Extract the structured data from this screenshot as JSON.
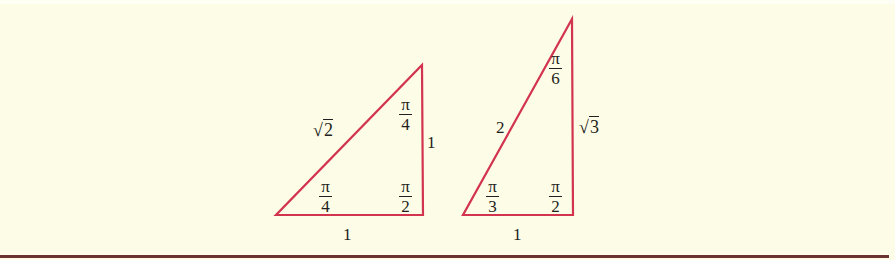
{
  "colors": {
    "background": "#fdfce6",
    "triangle_stroke": "#d2344f",
    "text": "#231f20",
    "bottom_rule": "#6b3330"
  },
  "triangles": [
    {
      "name": "45-45-90",
      "vertices": {
        "left": [
          276,
          215
        ],
        "right_bottom": [
          423,
          215
        ],
        "top": [
          422,
          65
        ]
      },
      "sides": {
        "hypotenuse": {
          "sym": "√",
          "rad": "2"
        },
        "vertical": "1",
        "base": "1"
      },
      "angles": {
        "bottom_left": {
          "num": "π",
          "den": "4"
        },
        "top": {
          "num": "π",
          "den": "4"
        },
        "bottom_right": {
          "num": "π",
          "den": "2"
        }
      }
    },
    {
      "name": "30-60-90",
      "vertices": {
        "left": [
          463,
          215
        ],
        "right_bottom": [
          573,
          215
        ],
        "top": [
          572,
          19
        ]
      },
      "sides": {
        "hypotenuse": "2",
        "vertical": {
          "sym": "√",
          "rad": "3"
        },
        "base": "1"
      },
      "angles": {
        "bottom_left": {
          "num": "π",
          "den": "3"
        },
        "top": {
          "num": "π",
          "den": "6"
        },
        "bottom_right": {
          "num": "π",
          "den": "2"
        }
      }
    }
  ]
}
